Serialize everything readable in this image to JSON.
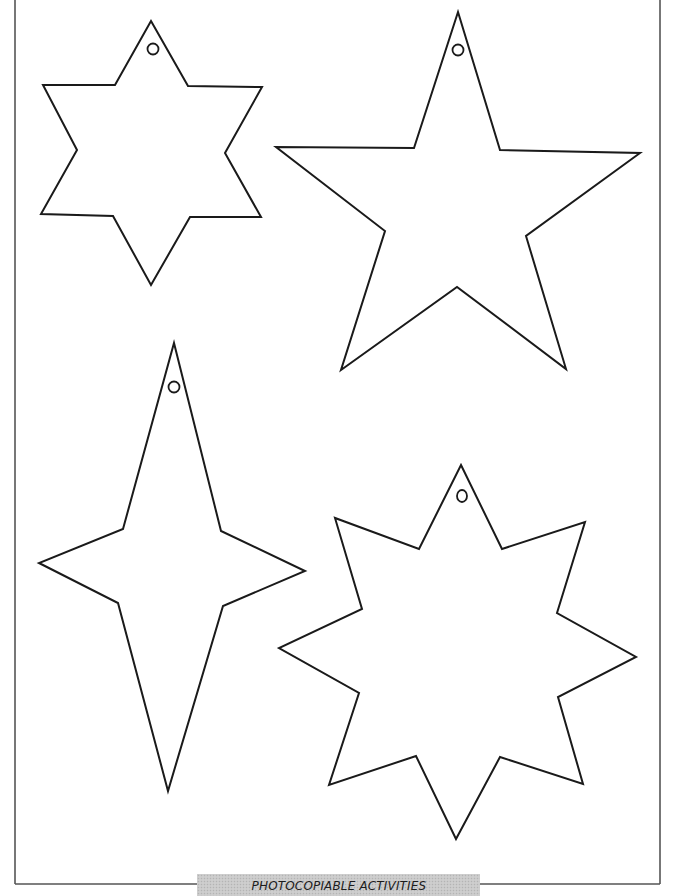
{
  "page": {
    "background": "#ffffff",
    "line_color": "#1a1a1a",
    "frame_color": "#555555"
  },
  "footer": {
    "label": "PHOTOCOPIABLE ACTIVITIES",
    "banner_color": "#c9c9c9"
  },
  "shapes": [
    {
      "name": "six-pointed-star",
      "points": 6,
      "position": "top-left",
      "has_hanging_hole": true
    },
    {
      "name": "five-pointed-star",
      "points": 5,
      "position": "top-right",
      "has_hanging_hole": true
    },
    {
      "name": "four-pointed-star",
      "points": 4,
      "position": "bottom-left",
      "has_hanging_hole": true
    },
    {
      "name": "eight-pointed-star",
      "points": 8,
      "position": "bottom-right",
      "has_hanging_hole": true
    }
  ]
}
